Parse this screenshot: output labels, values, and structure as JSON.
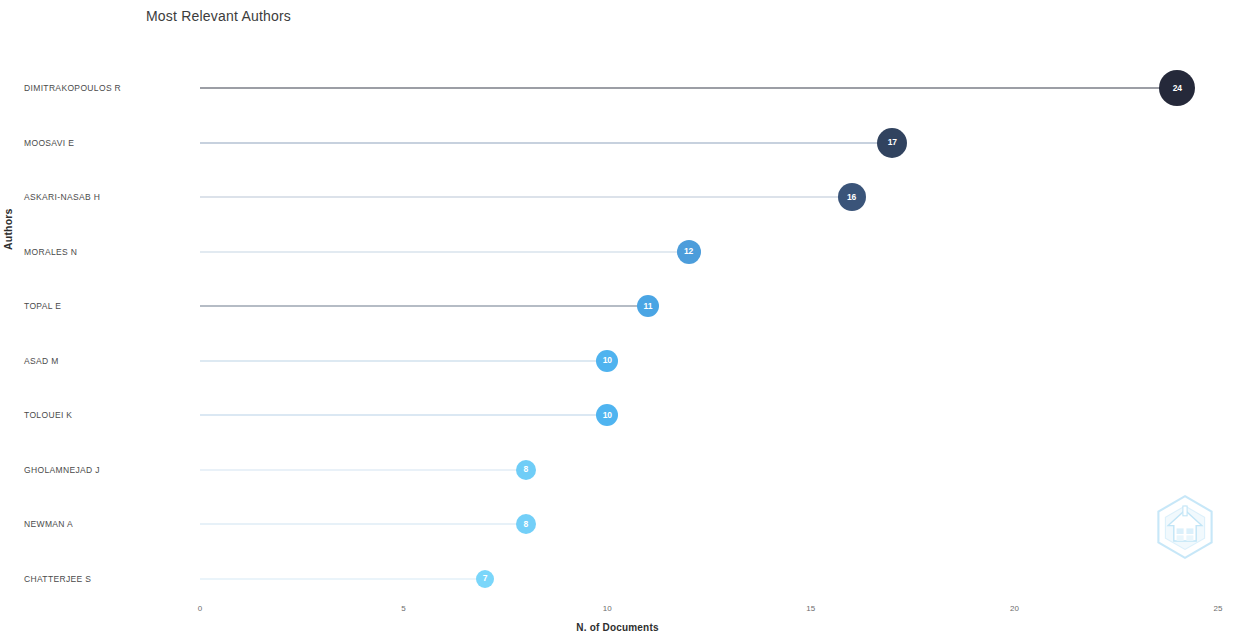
{
  "chart_data": {
    "type": "bar",
    "subtype": "lollipop-horizontal",
    "title": "Most Relevant Authors",
    "xlabel": "N. of Documents",
    "ylabel": "Authors",
    "xlim": [
      0,
      25
    ],
    "xticks": [
      "0",
      "5",
      "10",
      "15",
      "20",
      "25"
    ],
    "grid": false,
    "legend": "none",
    "categories": [
      "DIMITRAKOPOULOS R",
      "MOOSAVI E",
      "ASKARI-NASAB H",
      "MORALES N",
      "TOPAL E",
      "ASAD M",
      "TOLOUEI K",
      "GHOLAMNEJAD J",
      "NEWMAN A",
      "CHATTERJEE S"
    ],
    "values": [
      24,
      17,
      16,
      12,
      11,
      10,
      10,
      8,
      8,
      7
    ],
    "point_labels": [
      "24",
      "17",
      "16",
      "12",
      "11",
      "10",
      "10",
      "8",
      "8",
      "7"
    ],
    "point_colors": [
      "#25293a",
      "#31435f",
      "#3a5479",
      "#4c9ddb",
      "#4aa5e4",
      "#4fb3ef",
      "#4fb4f0",
      "#6fcdf7",
      "#73cff8",
      "#7ad6fa"
    ],
    "line_colors": [
      "#3a3f4d",
      "#8fa3bd",
      "#b9c6d6",
      "#c6d6e4",
      "#6d7b8c",
      "#bcd3e6",
      "#b7d2e8",
      "#d3e4f1",
      "#cfe3f2",
      "#d6e9f6"
    ],
    "point_radii": [
      18,
      15,
      14,
      12,
      11,
      11,
      11,
      10,
      10,
      9
    ]
  },
  "watermark": {
    "name": "hexagon-logo-watermark",
    "color": "#8fd4f5"
  }
}
